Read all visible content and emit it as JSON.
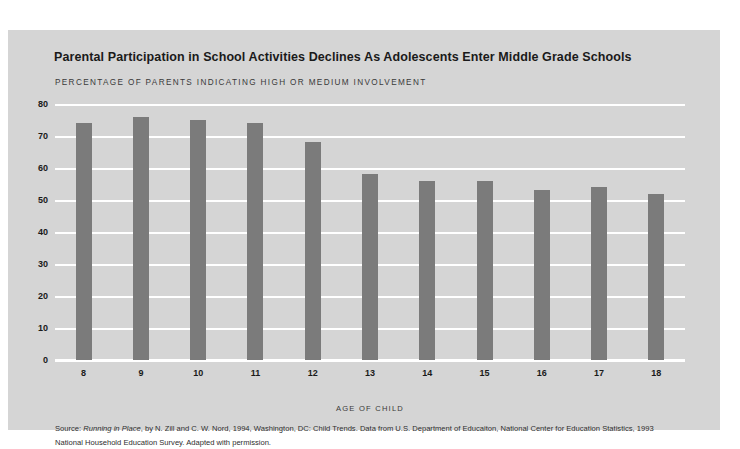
{
  "chart_data": {
    "type": "bar",
    "title": "Parental Participation in School Activities Declines As Adolescents Enter Middle Grade Schools",
    "subtitle": "PERCENTAGE OF PARENTS INDICATING HIGH OR MEDIUM INVOLVEMENT",
    "xlabel": "AGE OF CHILD",
    "ylabel": "",
    "categories": [
      "8",
      "9",
      "10",
      "11",
      "12",
      "13",
      "14",
      "15",
      "16",
      "17",
      "18"
    ],
    "values": [
      74,
      76,
      75,
      74,
      68,
      58,
      56,
      56,
      53,
      54,
      52
    ],
    "ylim": [
      0,
      80
    ],
    "yticks": [
      "0",
      "10",
      "20",
      "30",
      "40",
      "50",
      "60",
      "70",
      "80"
    ],
    "ytick_values": [
      0,
      10,
      20,
      30,
      40,
      50,
      60,
      70,
      80
    ],
    "grid": true,
    "legend": "none",
    "bar_color": "#7b7b7b",
    "plot_background": "#d5d5d5",
    "gridline_color": "#ffffff"
  },
  "source": {
    "prefix": "Source: ",
    "title_italic": "Running in Place",
    "rest": ", by N. Zill and C. W. Nord, 1994, Washington, DC: Child Trends. Data from U.S. Department of Educaiton, National Center for Education Statistics, 1993 National Household Education Survey. Adapted with permission."
  }
}
